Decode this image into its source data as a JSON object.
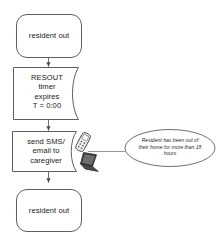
{
  "diagram": {
    "background_color": "#ffffff",
    "stroke_color": "#4d4d4d",
    "text_color": "#1a1a1a",
    "nodes": {
      "start": {
        "shape": "terminator",
        "label": "resident out"
      },
      "timer": {
        "shape": "delay",
        "label": "RESOUT\ntimer\nexpires\nT = 0:00"
      },
      "send": {
        "shape": "delay",
        "label": "send SMS/\nemail to\ncaregiver"
      },
      "end": {
        "shape": "terminator",
        "label": "resident out"
      },
      "note": {
        "shape": "ellipse",
        "label": "Resident has been out of\ntheir home for more than 18\nhours"
      }
    },
    "icons": {
      "mobile_phone": "mobile-phone-icon",
      "laptop": "laptop-icon"
    },
    "connectors": [
      {
        "from": "start",
        "to": "timer",
        "arrow": true
      },
      {
        "from": "timer",
        "to": "send",
        "arrow": true
      },
      {
        "from": "send",
        "to": "end",
        "arrow": true
      },
      {
        "from": "note",
        "to": "send",
        "arrow": false
      }
    ]
  }
}
